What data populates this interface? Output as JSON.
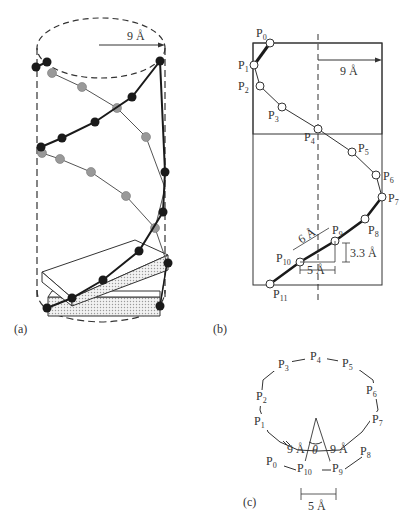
{
  "panels": {
    "a": {
      "label": "(a)",
      "radius_label": "9 Å",
      "description": "Helical chain of beads wound around a dashed cylinder, with two strands (dark and gray beads) and stacked slabs at the bottom"
    },
    "b": {
      "label": "(b)",
      "radius_label": "9 Å",
      "points": [
        "P0",
        "P1",
        "P2",
        "P3",
        "P4",
        "P5",
        "P6",
        "P7",
        "P8",
        "P9",
        "P10",
        "P11"
      ],
      "dim_6": "6 Å",
      "dim_5": "5 Å",
      "dim_33": "3.3 Å"
    },
    "c": {
      "label": "(c)",
      "points": [
        "P0",
        "P1",
        "P2",
        "P3",
        "P4",
        "P5",
        "P6",
        "P7",
        "P8",
        "P9",
        "P10"
      ],
      "left_radius": "9 Å",
      "right_radius": "9 Å",
      "angle": "θ",
      "chord": "5 Å"
    }
  },
  "colors": {
    "ink": "#333333",
    "dark_bead": "#1a1a1a",
    "gray_bead": "#999999",
    "slab_fill": "#dcdcdc"
  }
}
